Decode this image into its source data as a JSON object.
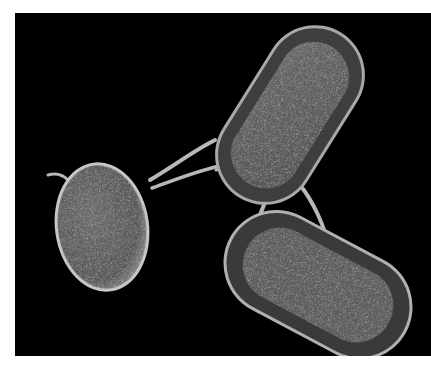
{
  "image": {
    "subject": "scanning electron micrograph of three rod-shaped bacteria connected by thin appendages",
    "background_color": "#000000",
    "border_color": "#ffffff",
    "cells": [
      {
        "name": "left-oval-cell",
        "cx": 102,
        "cy": 227,
        "rx": 46,
        "ry": 64,
        "rotation": -8
      },
      {
        "name": "top-rod-cell",
        "cx": 290,
        "cy": 115,
        "rx": 48,
        "ry": 95,
        "rotation": 32
      },
      {
        "name": "bottom-rod-cell",
        "cx": 318,
        "cy": 285,
        "rx": 98,
        "ry": 52,
        "rotation": 28
      }
    ]
  }
}
